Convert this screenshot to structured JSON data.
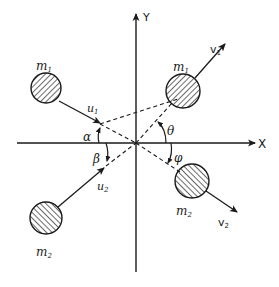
{
  "diagram": {
    "type": "two-body collision (before and after) in X-Y plane",
    "axes": {
      "x_label": "X",
      "y_label": "Y"
    },
    "before": {
      "body1": {
        "mass": "m",
        "mass_sub": "1",
        "velocity": "u",
        "velocity_sub": "1",
        "angle": "α",
        "quadrant": "upper-left"
      },
      "body2": {
        "mass": "m",
        "mass_sub": "2",
        "velocity": "u",
        "velocity_sub": "2",
        "angle": "β",
        "quadrant": "lower-left"
      }
    },
    "after": {
      "body1": {
        "mass": "m",
        "mass_sub": "1",
        "velocity": "v",
        "velocity_sub": "1",
        "angle": "θ",
        "quadrant": "upper-right"
      },
      "body2": {
        "mass": "m",
        "mass_sub": "2",
        "velocity": "v",
        "velocity_sub": "2",
        "angle": "φ",
        "quadrant": "lower-right"
      }
    },
    "colors": {
      "ink": "#1a1a1a",
      "background": "#ffffff"
    }
  }
}
